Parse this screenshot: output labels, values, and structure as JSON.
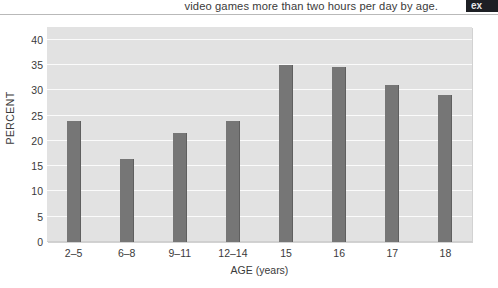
{
  "caption": {
    "text": "video games more than two hours per day by age.",
    "badge_label": "ex"
  },
  "chart_data": {
    "type": "bar",
    "title": "",
    "categories": [
      "2–5",
      "6–8",
      "9–11",
      "12–14",
      "15",
      "16",
      "17",
      "18"
    ],
    "values": [
      24,
      16.5,
      21.5,
      24,
      35,
      34.5,
      31,
      29
    ],
    "xlabel": "AGE (years)",
    "ylabel": "PERCENT",
    "ylim": [
      0,
      42.5
    ],
    "yticks": [
      0,
      5,
      10,
      15,
      20,
      25,
      30,
      35,
      40
    ],
    "ytick_labels": [
      "0",
      "5",
      "10",
      "15",
      "20",
      "25",
      "30",
      "35",
      "40"
    ],
    "grid": true,
    "legend": false,
    "bar_color": "#767676",
    "plot_background": "#e2e2e2",
    "gridline_color": "#fbfbfb"
  }
}
